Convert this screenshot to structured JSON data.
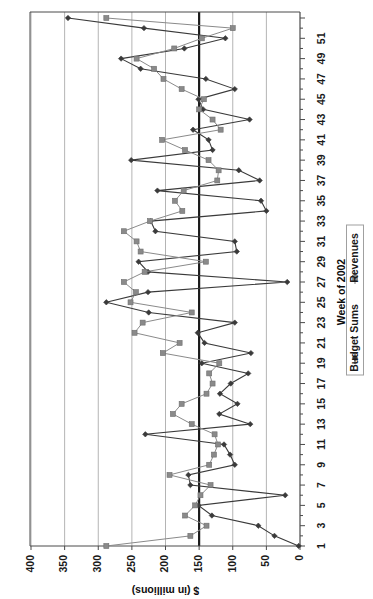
{
  "chart_data": {
    "type": "line",
    "title": "",
    "orientation": "rotated-90-ccw",
    "xlabel": "Week of 2002",
    "ylabel": "$ (in millions)",
    "ylim": [
      0,
      400
    ],
    "yticks": [
      0,
      50,
      100,
      150,
      200,
      250,
      300,
      350,
      400
    ],
    "ytick_labels": [
      "0",
      "50",
      "100",
      "150",
      "200",
      "250",
      "300",
      "350",
      "400"
    ],
    "xticks": [
      1,
      3,
      5,
      7,
      9,
      11,
      13,
      15,
      17,
      19,
      21,
      23,
      25,
      27,
      29,
      31,
      33,
      35,
      37,
      39,
      41,
      43,
      45,
      47,
      49,
      51
    ],
    "xtick_labels": [
      "1",
      "3",
      "5",
      "7",
      "9",
      "11",
      "13",
      "15",
      "17",
      "19",
      "21",
      "23",
      "25",
      "27",
      "29",
      "31",
      "33",
      "35",
      "37",
      "39",
      "41",
      "43",
      "45",
      "47",
      "49",
      "51"
    ],
    "grid": true,
    "grid_axis": "value",
    "legend_position": "right",
    "target_line_value": 150,
    "x": [
      1,
      2,
      3,
      4,
      5,
      6,
      7,
      8,
      9,
      10,
      11,
      12,
      13,
      14,
      15,
      16,
      17,
      18,
      19,
      20,
      21,
      22,
      23,
      24,
      25,
      26,
      27,
      28,
      29,
      30,
      31,
      32,
      33,
      34,
      35,
      36,
      37,
      38,
      39,
      40,
      41,
      42,
      43,
      44,
      45,
      46,
      47,
      48,
      49,
      50,
      51,
      52,
      53
    ],
    "series": [
      {
        "name": "Budget Sums",
        "marker": "diamond",
        "color": "#3a3a3a",
        "values": [
          2,
          38,
          62,
          131,
          151,
          22,
          163,
          166,
          97,
          104,
          113,
          230,
          74,
          120,
          93,
          119,
          103,
          77,
          146,
          73,
          142,
          152,
          97,
          225,
          288,
          226,
          19,
          226,
          240,
          94,
          97,
          215,
          222,
          50,
          58,
          212,
          60,
          91,
          251,
          130,
          136,
          159,
          75,
          144,
          151,
          97,
          140,
          237,
          266,
          172,
          111,
          232,
          345
        ]
      },
      {
        "name": "Revenues",
        "marker": "square",
        "color": "#8a8a8a",
        "values": [
          288,
          163,
          139,
          171,
          156,
          148,
          133,
          194,
          135,
          128,
          122,
          127,
          161,
          189,
          176,
          139,
          130,
          135,
          120,
          204,
          179,
          246,
          234,
          161,
          252,
          244,
          262,
          231,
          140,
          237,
          243,
          262,
          223,
          175,
          186,
          173,
          123,
          121,
          136,
          171,
          205,
          118,
          130,
          150,
          143,
          176,
          203,
          217,
          243,
          187,
          146,
          100,
          288
        ]
      }
    ]
  },
  "legend": {
    "entries": [
      {
        "label": "Budget Sums",
        "marker": "diamond-marker"
      },
      {
        "label": "Revenues",
        "marker": "square-marker"
      }
    ]
  },
  "axes": {
    "category_axis_title": "Week of 2002",
    "value_axis_title": "$ (in millions)"
  }
}
